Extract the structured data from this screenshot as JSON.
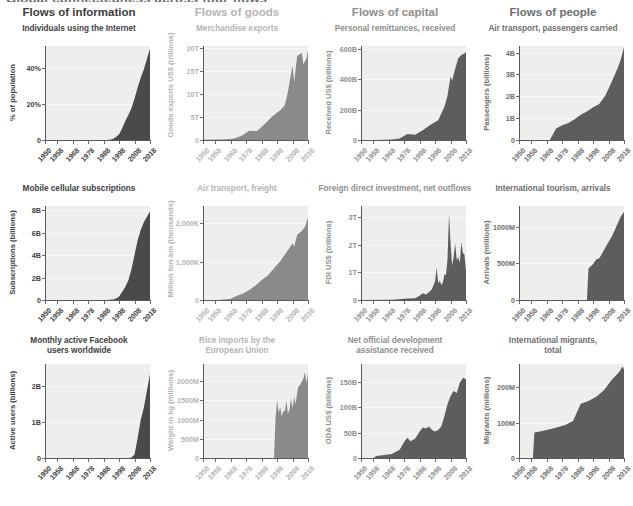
{
  "supertitle": "Global connectedness across four flows",
  "columns": [
    {
      "label": "Flows of information",
      "color": "#3d3d3d"
    },
    {
      "label": "Flows of goods",
      "color": "#b4b4b4"
    },
    {
      "label": "Flows of capital",
      "color": "#8e8e8e"
    },
    {
      "label": "Flows of people",
      "color": "#6d6d6d"
    }
  ],
  "xticks": [
    "1950",
    "1958",
    "1968",
    "1978",
    "1988",
    "1998",
    "2008",
    "2018"
  ],
  "chart_data": [
    {
      "type": "area",
      "title": "Individuals using the Internet",
      "ylabel": "% of population",
      "xlabel": "",
      "title_color": "#3d3d3d",
      "fill": "#4a4a4a",
      "panel_bg": "#eeeeec",
      "grid": true,
      "xlim": [
        1950,
        2018
      ],
      "ylim": [
        0,
        52
      ],
      "yticks": [
        0,
        20,
        40
      ],
      "yticklabels": [
        "0",
        "20%",
        "40%"
      ],
      "x": [
        1950,
        1958,
        1968,
        1978,
        1988,
        1990,
        1992,
        1994,
        1996,
        1998,
        2000,
        2002,
        2004,
        2006,
        2008,
        2010,
        2012,
        2014,
        2016,
        2018
      ],
      "values": [
        0,
        0,
        0,
        0,
        0,
        0.05,
        0.2,
        0.6,
        1.6,
        3.2,
        6.5,
        10.5,
        13.8,
        17.5,
        23.0,
        29.0,
        34.5,
        39.0,
        45.0,
        50.5
      ]
    },
    {
      "type": "area",
      "title": "Merchandise exports",
      "ylabel": "Goods exports US$ (trillions)",
      "xlabel": "",
      "title_color": "#b4b4b4",
      "fill": "#8a8a8a",
      "panel_bg": "#eeeeec",
      "grid": true,
      "xlim": [
        1950,
        2018
      ],
      "ylim": [
        0,
        20.5
      ],
      "yticks": [
        0,
        5,
        10,
        15,
        20
      ],
      "yticklabels": [
        "0",
        "5T",
        "10T",
        "15T",
        "20T"
      ],
      "x": [
        1950,
        1958,
        1965,
        1970,
        1975,
        1980,
        1985,
        1990,
        1995,
        2000,
        2003,
        2005,
        2008,
        2009,
        2011,
        2014,
        2015,
        2017,
        2018
      ],
      "values": [
        0.06,
        0.11,
        0.19,
        0.32,
        0.9,
        2.0,
        1.95,
        3.5,
        5.2,
        6.5,
        7.6,
        10.5,
        16.3,
        12.6,
        18.3,
        19.0,
        16.5,
        17.8,
        19.5
      ]
    },
    {
      "type": "area",
      "title": "Personal remittances, received",
      "ylabel": "Received US$ (billions)",
      "xlabel": "",
      "title_color": "#8e8e8e",
      "fill": "#5d5d5d",
      "panel_bg": "#eeeeec",
      "grid": true,
      "xlim": [
        1950,
        2018
      ],
      "ylim": [
        0,
        620
      ],
      "yticks": [
        0,
        200,
        400,
        600
      ],
      "yticklabels": [
        "0",
        "200B",
        "400B",
        "600B"
      ],
      "x": [
        1950,
        1960,
        1970,
        1975,
        1980,
        1985,
        1990,
        1995,
        2000,
        2004,
        2006,
        2008,
        2009,
        2011,
        2013,
        2015,
        2017,
        2018
      ],
      "values": [
        0,
        0,
        3,
        10,
        40,
        35,
        65,
        100,
        130,
        220,
        290,
        420,
        390,
        470,
        540,
        560,
        570,
        580
      ]
    },
    {
      "type": "area",
      "title": "Air transport, passengers carried",
      "ylabel": "Passengers (billions)",
      "xlabel": "",
      "title_color": "#6d6d6d",
      "fill": "#5d5d5d",
      "panel_bg": "#eeeeec",
      "grid": true,
      "xlim": [
        1950,
        2018
      ],
      "ylim": [
        0,
        4.3
      ],
      "yticks": [
        0,
        1,
        2,
        3,
        4
      ],
      "yticklabels": [
        "0",
        "1B",
        "2B",
        "3B",
        "4B"
      ],
      "x": [
        1950,
        1960,
        1970,
        1974,
        1978,
        1982,
        1986,
        1990,
        1994,
        1998,
        2002,
        2006,
        2010,
        2014,
        2016,
        2018
      ],
      "values": [
        0,
        0,
        0,
        0.53,
        0.68,
        0.78,
        0.95,
        1.15,
        1.3,
        1.5,
        1.65,
        2.05,
        2.65,
        3.3,
        3.7,
        4.25
      ]
    },
    {
      "type": "area",
      "title": "Mobile cellular subscriptions",
      "ylabel": "Subscriptions (billions)",
      "xlabel": "",
      "title_color": "#3d3d3d",
      "fill": "#4a4a4a",
      "panel_bg": "#eeeeec",
      "grid": true,
      "xlim": [
        1950,
        2018
      ],
      "ylim": [
        0,
        8.4
      ],
      "yticks": [
        0,
        2,
        4,
        6,
        8
      ],
      "yticklabels": [
        "0",
        "2B",
        "4B",
        "6B",
        "8B"
      ],
      "x": [
        1950,
        1980,
        1990,
        1994,
        1996,
        1998,
        2000,
        2002,
        2004,
        2006,
        2008,
        2010,
        2012,
        2014,
        2016,
        2018
      ],
      "values": [
        0,
        0,
        0.01,
        0.05,
        0.14,
        0.32,
        0.74,
        1.16,
        1.77,
        2.75,
        4.05,
        5.35,
        6.25,
        6.95,
        7.45,
        7.9
      ]
    },
    {
      "type": "area",
      "title": "Air transport, freight",
      "ylabel": "Million ton-km (thousands)",
      "xlabel": "",
      "title_color": "#b4b4b4",
      "fill": "#8a8a8a",
      "panel_bg": "#eeeeec",
      "grid": true,
      "xlim": [
        1950,
        2018
      ],
      "ylim": [
        0,
        2450
      ],
      "yticks": [
        0,
        1000,
        2000
      ],
      "yticklabels": [
        "0",
        "1,000K",
        "2,000K"
      ],
      "x": [
        1950,
        1960,
        1968,
        1972,
        1976,
        1980,
        1984,
        1988,
        1992,
        1996,
        2000,
        2004,
        2008,
        2009,
        2011,
        2014,
        2016,
        2018
      ],
      "values": [
        0,
        0,
        30,
        110,
        170,
        260,
        380,
        520,
        640,
        830,
        1010,
        1240,
        1480,
        1390,
        1700,
        1800,
        1900,
        2150
      ]
    },
    {
      "type": "area",
      "title": "Foreign direct investment, net outflows",
      "ylabel": "FDI US$ (trillions)",
      "xlabel": "",
      "title_color": "#8e8e8e",
      "fill": "#5d5d5d",
      "panel_bg": "#eeeeec",
      "grid": true,
      "xlim": [
        1950,
        2018
      ],
      "ylim": [
        0,
        3.4
      ],
      "yticks": [
        0,
        1,
        2,
        3
      ],
      "yticklabels": [
        "0",
        "1T",
        "2T",
        "3T"
      ],
      "x": [
        1950,
        1970,
        1980,
        1985,
        1988,
        1990,
        1992,
        1994,
        1996,
        1998,
        1999,
        2000,
        2001,
        2002,
        2003,
        2004,
        2005,
        2006,
        2007,
        2008,
        2009,
        2010,
        2011,
        2012,
        2013,
        2014,
        2015,
        2016,
        2017,
        2018
      ],
      "values": [
        0,
        0.01,
        0.05,
        0.06,
        0.15,
        0.24,
        0.2,
        0.28,
        0.4,
        0.68,
        1.18,
        0.6,
        0.7,
        0.55,
        0.62,
        0.92,
        0.9,
        1.45,
        3.1,
        2.05,
        1.25,
        1.55,
        2.05,
        1.45,
        1.55,
        1.35,
        2.1,
        1.7,
        1.65,
        1.05
      ]
    },
    {
      "type": "area",
      "title": "International tourism, arrivals",
      "ylabel": "Arrivals (millions)",
      "xlabel": "",
      "title_color": "#6d6d6d",
      "fill": "#5d5d5d",
      "panel_bg": "#eeeeec",
      "grid": true,
      "xlim": [
        1950,
        2018
      ],
      "ylim": [
        0,
        1280
      ],
      "yticks": [
        0,
        500,
        1000
      ],
      "yticklabels": [
        "0",
        "500M",
        "1000M"
      ],
      "x": [
        1950,
        1990,
        1994,
        1995,
        1996,
        1998,
        2000,
        2002,
        2004,
        2006,
        2008,
        2010,
        2012,
        2014,
        2016,
        2018
      ],
      "values": [
        0,
        0,
        0,
        430,
        450,
        490,
        550,
        570,
        640,
        720,
        790,
        860,
        950,
        1050,
        1140,
        1200
      ]
    },
    {
      "type": "area",
      "title": "Monthly active Facebook\nusers worldwide",
      "ylabel": "Active users (billions)",
      "xlabel": "",
      "title_color": "#3d3d3d",
      "fill": "#4a4a4a",
      "panel_bg": "#eeeeec",
      "grid": true,
      "xlim": [
        1950,
        2018
      ],
      "ylim": [
        0,
        2.6
      ],
      "yticks": [
        0,
        1,
        2
      ],
      "yticklabels": [
        "0",
        "1B",
        "2B"
      ],
      "x": [
        1950,
        2004,
        2006,
        2008,
        2010,
        2012,
        2014,
        2016,
        2018
      ],
      "values": [
        0,
        0,
        0.012,
        0.1,
        0.55,
        1.06,
        1.39,
        1.86,
        2.32
      ]
    },
    {
      "type": "area",
      "title": "Rice imports by the\nEuropean Union",
      "ylabel": "Weight in kg (millions)",
      "xlabel": "",
      "title_color": "#b4b4b4",
      "fill": "#8a8a8a",
      "panel_bg": "#eeeeec",
      "grid": true,
      "xlim": [
        1950,
        2018
      ],
      "ylim": [
        0,
        2450
      ],
      "yticks": [
        0,
        500,
        1000,
        1500,
        2000
      ],
      "yticklabels": [
        "0",
        "500M",
        "1000M",
        "1500M",
        "2000M"
      ],
      "x": [
        1950,
        1996,
        1997,
        1998,
        1999,
        2000,
        2001,
        2002,
        2003,
        2004,
        2005,
        2006,
        2007,
        2008,
        2009,
        2010,
        2011,
        2012,
        2013,
        2014,
        2015,
        2016,
        2017,
        2018
      ],
      "values": [
        0,
        0,
        1050,
        1500,
        1180,
        1320,
        1090,
        1220,
        1230,
        1480,
        1160,
        1260,
        1560,
        1290,
        1600,
        1400,
        1700,
        1880,
        1900,
        2000,
        2060,
        2240,
        1960,
        2200
      ]
    },
    {
      "type": "area",
      "title": "Net official development\nassistance received",
      "ylabel": "ODA US$ (billions)",
      "xlabel": "",
      "title_color": "#8e8e8e",
      "fill": "#5d5d5d",
      "panel_bg": "#eeeeec",
      "grid": true,
      "xlim": [
        1950,
        2018
      ],
      "ylim": [
        0,
        185
      ],
      "yticks": [
        0,
        50,
        100,
        150
      ],
      "yticklabels": [
        "0",
        "50B",
        "100B",
        "150B"
      ],
      "x": [
        1950,
        1958,
        1960,
        1965,
        1970,
        1975,
        1978,
        1980,
        1982,
        1985,
        1988,
        1990,
        1992,
        1994,
        1996,
        1998,
        2000,
        2002,
        2004,
        2006,
        2008,
        2010,
        2012,
        2014,
        2016,
        2018
      ],
      "values": [
        0,
        0,
        4,
        6,
        8,
        16,
        32,
        40,
        33,
        38,
        52,
        60,
        58,
        62,
        55,
        52,
        55,
        62,
        82,
        106,
        122,
        132,
        128,
        148,
        158,
        155
      ]
    },
    {
      "type": "area",
      "title": "International migrants,\ntotal",
      "ylabel": "Migrants (millions)",
      "xlabel": "",
      "title_color": "#6d6d6d",
      "fill": "#5d5d5d",
      "panel_bg": "#eeeeec",
      "grid": true,
      "xlim": [
        1950,
        2018
      ],
      "ylim": [
        0,
        265
      ],
      "yticks": [
        0,
        100,
        200
      ],
      "yticklabels": [
        "0",
        "100M",
        "200M"
      ],
      "x": [
        1950,
        1959,
        1960,
        1965,
        1970,
        1975,
        1980,
        1985,
        1990,
        1995,
        2000,
        2005,
        2010,
        2015,
        2017,
        2018
      ],
      "values": [
        0,
        0,
        72,
        76,
        81,
        87,
        93,
        104,
        153,
        161,
        173,
        191,
        220,
        243,
        258,
        250
      ]
    }
  ]
}
